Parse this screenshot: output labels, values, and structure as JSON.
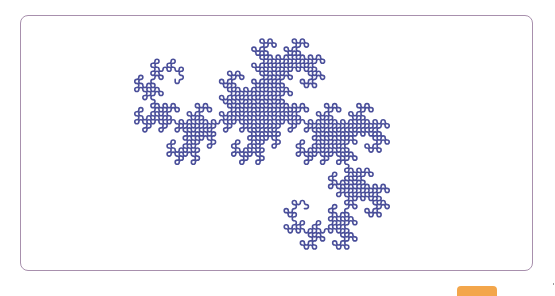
{
  "figure": {
    "type": "heighway-dragon-curve",
    "order": 11,
    "stroke_color": "#4a4f9a",
    "stroke_width": 1.6,
    "bbox": {
      "x": 117,
      "y": 39,
      "width": 290,
      "height": 210
    }
  },
  "frame": {
    "border_color": "#a890ad"
  },
  "button": {
    "color": "#f3a64b",
    "label": ""
  }
}
